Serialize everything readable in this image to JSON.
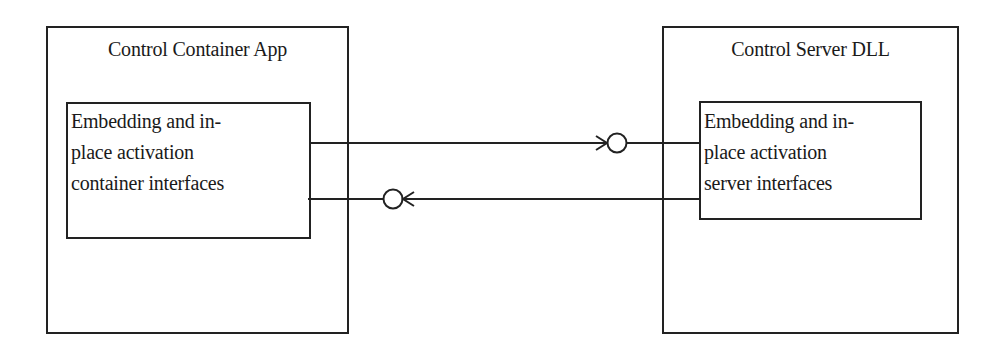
{
  "diagram": {
    "left_component": {
      "title": "Control Container App",
      "inner_box": {
        "lines": [
          "Embedding and in-",
          "place activation",
          "container interfaces"
        ]
      }
    },
    "right_component": {
      "title": "Control Server DLL",
      "inner_box": {
        "lines": [
          "Embedding and in-",
          "place activation",
          "server interfaces"
        ]
      }
    },
    "connectors": [
      {
        "from": "container interfaces",
        "to": "server interfaces",
        "direction": "left-to-right",
        "end": "lollipop interface (server side)"
      },
      {
        "from": "server interfaces",
        "to": "container interfaces",
        "direction": "right-to-left",
        "end": "lollipop interface (container side)"
      }
    ],
    "colors": {
      "stroke": "#222222",
      "background": "#ffffff",
      "text": "#1a1a1a"
    }
  }
}
